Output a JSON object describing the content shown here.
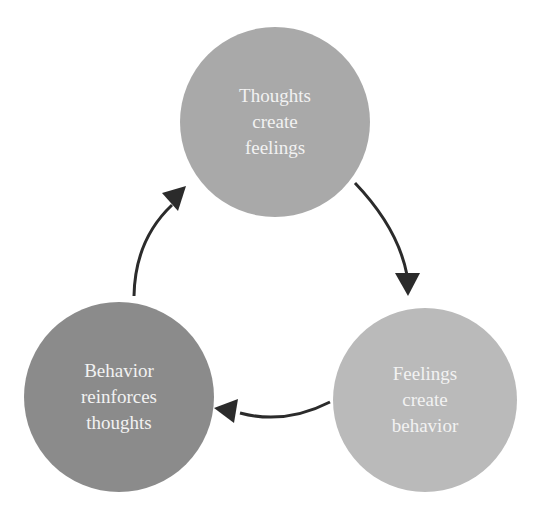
{
  "diagram": {
    "type": "cycle",
    "nodes": [
      {
        "id": "thoughts",
        "lines": [
          "Thoughts",
          "create",
          "feelings"
        ],
        "color": "#a9a9a9",
        "cx": 275,
        "cy": 122,
        "r": 95
      },
      {
        "id": "feelings",
        "lines": [
          "Feelings",
          "create",
          "behavior"
        ],
        "color": "#bababa",
        "cx": 425,
        "cy": 400,
        "r": 92
      },
      {
        "id": "behavior",
        "lines": [
          "Behavior",
          "reinforces",
          "thoughts"
        ],
        "color": "#8b8b8b",
        "cx": 119,
        "cy": 397,
        "r": 95
      }
    ],
    "edges": [
      {
        "from": "thoughts",
        "to": "feelings"
      },
      {
        "from": "feelings",
        "to": "behavior"
      },
      {
        "from": "behavior",
        "to": "thoughts"
      }
    ],
    "arrow_color": "#2b2b2b"
  }
}
